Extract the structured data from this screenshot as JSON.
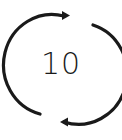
{
  "icon": {
    "name": "replay-10-icon",
    "label": "10",
    "color": "#1a1a1a",
    "background": "#ffffff"
  }
}
